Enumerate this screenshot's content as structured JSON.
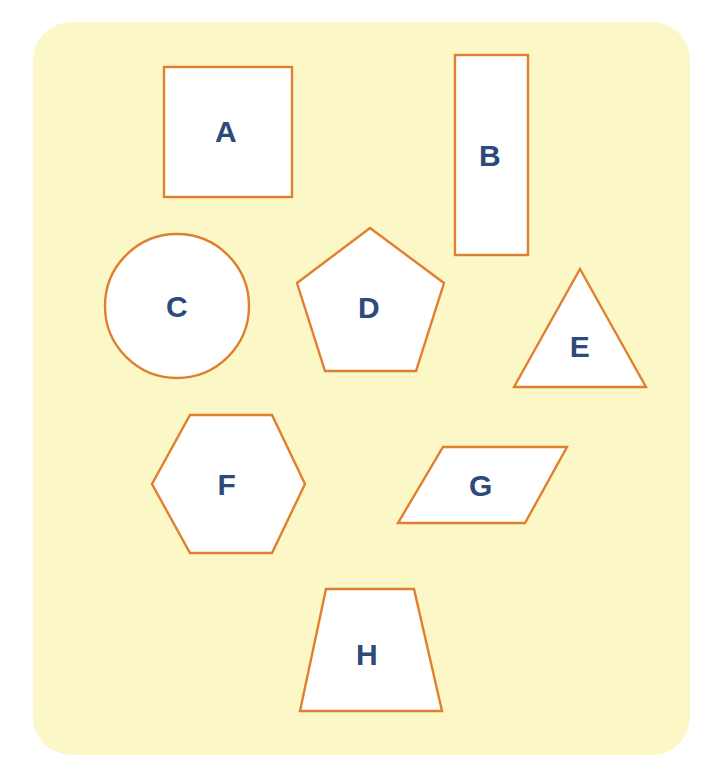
{
  "canvas": {
    "width": 709,
    "height": 780
  },
  "page_background": "#ffffff",
  "card": {
    "name": "shapes-worksheet-card",
    "fill": "#fbf7c6",
    "x": 33,
    "y": 22,
    "width": 657,
    "height": 733,
    "corner_radius": 38
  },
  "style": {
    "shape_fill": "#ffffff",
    "shape_stroke": "#e0802f",
    "shape_stroke_width": 2.4,
    "label_color": "#2d4a7c",
    "label_font_size": 30
  },
  "shapes": [
    {
      "id": "A",
      "label": "A",
      "kind": "square",
      "name": "shape-a-square",
      "geometry": {
        "type": "rect",
        "x": 164,
        "y": 67,
        "width": 128,
        "height": 130
      },
      "label_pos": {
        "x": 226,
        "y": 132
      }
    },
    {
      "id": "B",
      "label": "B",
      "kind": "rectangle",
      "name": "shape-b-rectangle",
      "geometry": {
        "type": "rect",
        "x": 455,
        "y": 55,
        "width": 73,
        "height": 200
      },
      "label_pos": {
        "x": 490,
        "y": 156
      }
    },
    {
      "id": "C",
      "label": "C",
      "kind": "circle",
      "name": "shape-c-circle",
      "geometry": {
        "type": "circle",
        "cx": 177,
        "cy": 306,
        "r": 72
      },
      "label_pos": {
        "x": 177,
        "y": 307
      }
    },
    {
      "id": "D",
      "label": "D",
      "kind": "pentagon",
      "name": "shape-d-pentagon",
      "geometry": {
        "type": "polygon",
        "points": "370,228 444,283 416,371 325,371 297,283"
      },
      "label_pos": {
        "x": 369,
        "y": 308
      }
    },
    {
      "id": "E",
      "label": "E",
      "kind": "triangle",
      "name": "shape-e-triangle",
      "geometry": {
        "type": "polygon",
        "points": "580,269 646,387 514,387"
      },
      "label_pos": {
        "x": 580,
        "y": 347
      }
    },
    {
      "id": "F",
      "label": "F",
      "kind": "hexagon",
      "name": "shape-f-hexagon",
      "geometry": {
        "type": "polygon",
        "points": "190,415 272,415 305,484 272,553 190,553 152,484"
      },
      "label_pos": {
        "x": 227,
        "y": 485
      }
    },
    {
      "id": "G",
      "label": "G",
      "kind": "parallelogram",
      "name": "shape-g-parallelogram",
      "geometry": {
        "type": "polygon",
        "points": "443,447 567,447 525,523 398,523"
      },
      "label_pos": {
        "x": 481,
        "y": 486
      }
    },
    {
      "id": "H",
      "label": "H",
      "kind": "trapezoid",
      "name": "shape-h-trapezoid",
      "geometry": {
        "type": "polygon",
        "points": "326,589 414,589 442,711 300,711"
      },
      "label_pos": {
        "x": 367,
        "y": 655
      }
    }
  ]
}
